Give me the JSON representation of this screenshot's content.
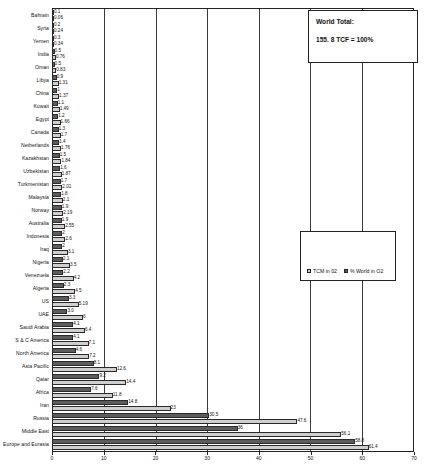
{
  "chart_data": {
    "type": "bar",
    "orientation": "horizontal",
    "title": "",
    "xlabel": "",
    "ylabel": "",
    "xlim": [
      0,
      70
    ],
    "xticks": [
      0,
      10,
      20,
      30,
      40,
      50,
      60,
      70
    ],
    "grid": true,
    "legend_position": "center-right",
    "categories": [
      "Bahrain",
      "Syria",
      "Yemen",
      "India",
      "Oman",
      "Libya",
      "China",
      "Kuwait",
      "Egypt",
      "Canada",
      "Netherlands",
      "Kazakhstan",
      "Uzbekistan",
      "Turkmenistan",
      "Malaysia",
      "Norway",
      "Australia",
      "Indonesia",
      "Iraq",
      "Nigeria",
      "Venezuela",
      "Algeria",
      "US",
      "UAE",
      "Saudi Arabia",
      "S & C America",
      "North America",
      "Asia Pacific",
      "Qatar",
      "Africa",
      "Iran",
      "Russia",
      "Middle East",
      "Europe and Eurasia"
    ],
    "series": [
      {
        "name": "TCM in 02",
        "values": [
          0.1,
          0.2,
          0.3,
          0.5,
          0.5,
          0.9,
          1.0,
          1.1,
          1.2,
          1.3,
          1.4,
          1.5,
          1.6,
          1.7,
          1.8,
          1.9,
          1.9,
          2.0,
          2.0,
          2.1,
          2.2,
          2.3,
          3.3,
          3.0,
          4.1,
          4.1,
          4.6,
          8.1,
          9.2,
          7.6,
          14.8,
          30.5,
          36.0,
          58.8
        ]
      },
      {
        "name": "% World in O2",
        "values": [
          0.06,
          0.24,
          0.34,
          0.76,
          0.83,
          1.31,
          1.37,
          1.49,
          1.66,
          1.7,
          1.76,
          1.84,
          1.87,
          2.01,
          2.1,
          2.19,
          2.55,
          2.6,
          3.1,
          3.5,
          4.2,
          4.5,
          5.19,
          6.0,
          6.4,
          7.1,
          7.2,
          12.6,
          14.4,
          11.8,
          23.0,
          47.6,
          56.1,
          61.4
        ]
      }
    ],
    "value_labels_series1": [
      "0.1",
      "0.2",
      "0.3",
      "0.5",
      "0.5",
      "0.9",
      "1",
      "1.1",
      "1.2",
      "1.3",
      "1.4",
      "1.5",
      "1.6",
      "1.7",
      "1.8",
      "1.9",
      "1.9",
      "2",
      "2",
      "2.1",
      "2.2",
      "2.3",
      "3.3",
      "3.0",
      "4.1",
      "4.1",
      "4.6",
      "8.1",
      "9.2",
      "7.6",
      "14.8",
      "30.5",
      "36",
      "58.8"
    ],
    "value_labels_series2": [
      "0.06",
      "0.24",
      "0.34",
      "0.76",
      "0.83",
      "1.31",
      "1.37",
      "1.49",
      "1.66",
      "1.7",
      "1.76",
      "1.84",
      "1.87",
      "2.01",
      "2.1",
      "2.19",
      "2.55",
      "2.6",
      "3.1",
      "3.5",
      "4.2",
      "4.5",
      "5.19",
      "6",
      "6.4",
      "7.1",
      "7.2",
      "12.6",
      "14.4",
      "11.8",
      "23",
      "47.6",
      "56.1",
      "61.4"
    ],
    "colors": {
      "series1": "#5c5c5c",
      "series2": "#cfcfcf",
      "axis": "#222222",
      "background": "#ffffff"
    }
  },
  "callouts": {
    "world_total": {
      "title": "World Total:",
      "value": "155. 8 TCF = 100%"
    }
  },
  "legend": {
    "entries": [
      {
        "label": "TCM in 02"
      },
      {
        "label": "% World in O2"
      }
    ]
  }
}
